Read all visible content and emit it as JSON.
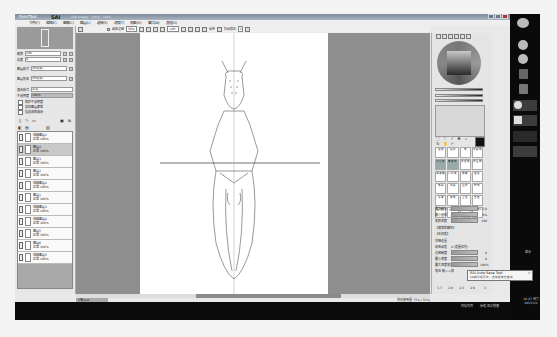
{
  "window": {
    "app_name": "SAI",
    "title_prefix": "PaintTool",
    "caption": "(flat image) · 100% · 16bit"
  },
  "menu": [
    "文件(F)",
    "编辑(E)",
    "图像(C)",
    "图层(L)",
    "选择(S)",
    "滤镜(T)",
    "视图(V)",
    "窗口(W)",
    "其他(O)"
  ],
  "navigator": {
    "zoom_label": "缩放",
    "zoom_value": "100",
    "angle_label": "角度",
    "angle_value": "0"
  },
  "layer_props": {
    "blend1_label": "图层模式",
    "blend1_value": "(无效果)",
    "blend2_label": "图层效果",
    "blend2_value": "(无效果)",
    "mode_label": "混合模式",
    "mode_value": "正常",
    "opacity_label": "不透明度",
    "opacity_value": "100%",
    "checks": [
      "保护不透明度",
      "剪贴图层蒙版",
      "指定选取来源"
    ]
  },
  "layer_tool_icons": [
    "new-layer",
    "new-linework",
    "new-folder",
    "delete",
    "merge-down",
    "clear",
    "copy",
    "paste",
    "trash"
  ],
  "layers": [
    {
      "name": "线稿图层1",
      "mode": "正常 100%",
      "selected": false
    },
    {
      "name": "图层4",
      "mode": "正常 100%",
      "selected": true
    },
    {
      "name": "图层3",
      "mode": "正常 100%",
      "selected": false
    },
    {
      "name": "图层2",
      "mode": "正常 100%",
      "selected": false
    },
    {
      "name": "线稿图层2",
      "mode": "正常 100%",
      "selected": false
    },
    {
      "name": "图层1",
      "mode": "正常 100%",
      "selected": false
    },
    {
      "name": "线稿图层3",
      "mode": "正常 100%",
      "selected": false
    },
    {
      "name": "线稿图层4",
      "mode": "正常 100%",
      "selected": false
    },
    {
      "name": "图层5",
      "mode": "正常 100%",
      "selected": false
    },
    {
      "name": "图层6",
      "mode": "正常 100%",
      "selected": false
    },
    {
      "name": "线稿图层5",
      "mode": "正常 100%",
      "selected": false
    }
  ],
  "toolbar": {
    "selection_label": "选区边缘",
    "selection_value": "50%",
    "angle_value": "+00°",
    "stabilizer_label": "抖动修正",
    "stabilizer_value": "3",
    "flip_label": "反转"
  },
  "color_panel": {
    "fg_color": "#111111"
  },
  "tools": [
    "select",
    "lasso",
    "magic-wand",
    "move",
    "zoom",
    "rotate",
    "hand",
    "eyedropper"
  ],
  "brushes": [
    "铅笔",
    "喷枪",
    "笔",
    "水彩笔",
    "马克笔",
    "橡皮擦",
    "选取笔",
    "选区擦",
    "油漆桶",
    "二值笔",
    "模糊",
    "混色",
    "笔刷",
    "水彩",
    "图层",
    "特效",
    "涂抹",
    "钢笔",
    "上色",
    "自定",
    "画笔1",
    "画笔2",
    "画笔3",
    "画笔4"
  ],
  "brush_props": {
    "size_label": "最大直径",
    "size_value": "5.0",
    "size_multiplier": "x 1.0",
    "min_label": "最小直径",
    "min_value": "0%",
    "density_label": "笔刷浓度",
    "density_value": "100",
    "shape_label": "【通常的圆形】",
    "texture_label": "【无材质】",
    "detail_label": "详细设置",
    "quality_label": "绘画品质",
    "quality_value": "4 (质量优先)",
    "edge_label": "边缘硬度",
    "edge_value": "0",
    "min_density_label": "最小浓度",
    "min_density_value": "0",
    "max_pressure_label": "最大浓度笔压",
    "max_pressure_value": "100%",
    "pressure_label": "笔压 硬<->软",
    "pressure_value": "",
    "sizes": [
      "1.7",
      "2.0",
      "2.3",
      "2.6",
      "3"
    ]
  },
  "status": {
    "doc_tab": "5喵.psd",
    "memory": "内存使用量 75% (72%)",
    "bottom_left": "内存负荷",
    "bottom_mid": "抬笔 显示快捷"
  },
  "notification": {
    "title": "SAI Auto Save Tool",
    "body": "SAI程序运行中，自动保存已启动",
    "close": "x"
  },
  "taskbar": {
    "tray_label": "显示",
    "clock_line1": "14:47 周六",
    "clock_line2": "2015/1/1"
  }
}
